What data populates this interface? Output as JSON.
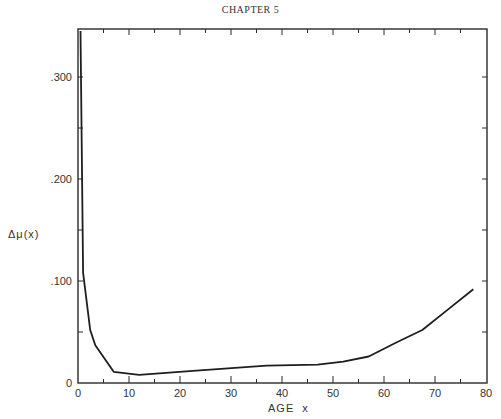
{
  "page": {
    "header": "CHAPTER 5"
  },
  "chart_data": {
    "type": "line",
    "title": "",
    "xlabel": "AGE",
    "xlabel_var": "x",
    "ylabel": "Δμ(x)",
    "xlim": [
      0,
      80
    ],
    "ylim": [
      0,
      0.35
    ],
    "x_ticks": [
      0,
      10,
      20,
      30,
      40,
      50,
      60,
      70,
      80
    ],
    "x_tick_labels": [
      "0",
      "10",
      "20",
      "30",
      "40",
      "50",
      "60",
      "70",
      "80"
    ],
    "x_minor_ticks": [
      5,
      15,
      25,
      35,
      45,
      55,
      65,
      75
    ],
    "y_ticks": [
      0,
      0.1,
      0.2,
      0.3
    ],
    "y_tick_labels": [
      "0",
      ".100",
      ".200",
      ".300"
    ],
    "y_minor_ticks": [
      0.05,
      0.15,
      0.25
    ],
    "grid": false,
    "legend": null,
    "series": [
      {
        "name": "Δμ(x)",
        "x": [
          0.5,
          1.0,
          2.4,
          3.4,
          7.0,
          12,
          22.5,
          37,
          47,
          52,
          57,
          62.5,
          67.5,
          72.5,
          77.5
        ],
        "values": [
          0.345,
          0.108,
          0.052,
          0.037,
          0.011,
          0.008,
          0.012,
          0.017,
          0.018,
          0.021,
          0.026,
          0.04,
          0.052,
          0.072,
          0.092
        ]
      }
    ]
  }
}
